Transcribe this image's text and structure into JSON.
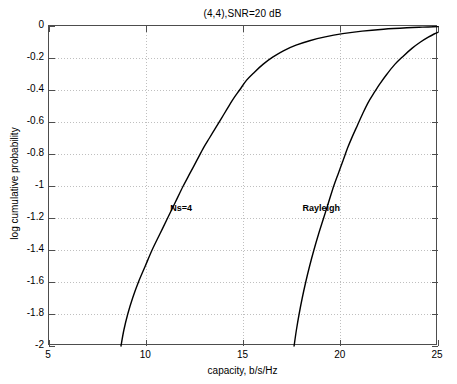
{
  "chart_data": {
    "type": "line",
    "title": "(4,4),SNR=20 dB",
    "xlabel": "capacity, b/s/Hz",
    "ylabel": "log cumulative probability",
    "xlim": [
      5,
      25
    ],
    "ylim": [
      -2,
      0
    ],
    "xticks": [
      5,
      10,
      15,
      20,
      25
    ],
    "xtick_labels": [
      "5",
      "10",
      "15",
      "20",
      "25"
    ],
    "yticks": [
      0,
      -0.2,
      -0.4,
      -0.6,
      -0.8,
      -1,
      -1.2,
      -1.4,
      -1.6,
      -1.8,
      -2
    ],
    "ytick_labels": [
      "0",
      "-0.2",
      "-0.4",
      "-0.6",
      "-0.8",
      "-1",
      "-1.2",
      "-1.4",
      "-1.6",
      "-1.8",
      "-2"
    ],
    "grid": true,
    "grid_style": "dotted",
    "grid_color": "#bfbfbf",
    "legend": "none",
    "line_color": "#000000",
    "series": [
      {
        "name": "Ns=4",
        "annotation": "Ns=4",
        "annotation_x": 11.8,
        "annotation_y": -1.14,
        "x": [
          8.7,
          8.85,
          9.05,
          9.3,
          9.6,
          9.95,
          10.3,
          10.7,
          11.1,
          11.5,
          11.9,
          12.25,
          12.6,
          12.95,
          13.25,
          13.55,
          13.85,
          14.15,
          14.45,
          14.8,
          15.15,
          15.55,
          16.0,
          16.5,
          17.05,
          17.7,
          18.4,
          19.2,
          20.1,
          21.1,
          22.2,
          23.4,
          24.2,
          25.0
        ],
        "y": [
          -2.0,
          -1.9,
          -1.8,
          -1.7,
          -1.6,
          -1.5,
          -1.4,
          -1.3,
          -1.2,
          -1.1,
          -1.0,
          -0.92,
          -0.84,
          -0.76,
          -0.7,
          -0.64,
          -0.58,
          -0.52,
          -0.46,
          -0.4,
          -0.34,
          -0.29,
          -0.24,
          -0.195,
          -0.155,
          -0.12,
          -0.092,
          -0.068,
          -0.048,
          -0.032,
          -0.02,
          -0.011,
          -0.007,
          -0.004
        ]
      },
      {
        "name": "Rayleigh",
        "annotation": "Rayleigh",
        "annotation_x": 19.0,
        "annotation_y": -1.14,
        "x": [
          17.6,
          17.72,
          17.86,
          18.02,
          18.2,
          18.4,
          18.62,
          18.86,
          19.12,
          19.38,
          19.64,
          19.88,
          20.12,
          20.36,
          20.6,
          20.86,
          21.12,
          21.4,
          21.7,
          22.02,
          22.38,
          22.78,
          23.2,
          23.66,
          24.1,
          24.5,
          24.8,
          25.0
        ],
        "y": [
          -2.0,
          -1.9,
          -1.8,
          -1.7,
          -1.6,
          -1.5,
          -1.4,
          -1.3,
          -1.2,
          -1.1,
          -1.0,
          -0.92,
          -0.84,
          -0.76,
          -0.69,
          -0.62,
          -0.55,
          -0.48,
          -0.42,
          -0.36,
          -0.3,
          -0.24,
          -0.19,
          -0.14,
          -0.1,
          -0.07,
          -0.05,
          -0.04
        ]
      }
    ]
  }
}
